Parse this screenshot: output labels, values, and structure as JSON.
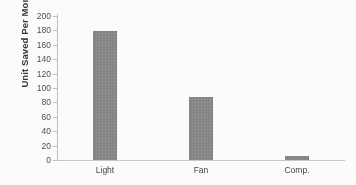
{
  "chart_data": {
    "type": "bar",
    "title": "",
    "subtitle": "",
    "xlabel": "",
    "ylabel": "Unit Saved Per Month",
    "categories": [
      "Light",
      "Fan",
      "Comp."
    ],
    "values": [
      179,
      87,
      6
    ],
    "series": [
      {
        "name": "Unit Saved Per Month",
        "values": [
          179,
          87,
          6
        ]
      }
    ],
    "ylim": [
      0,
      200
    ],
    "ytick_labels": [
      "0",
      "20",
      "40",
      "60",
      "80",
      "100",
      "120",
      "140",
      "160",
      "180",
      "200"
    ],
    "ytick_values": [
      0,
      20,
      40,
      60,
      80,
      100,
      120,
      140,
      160,
      180,
      200
    ],
    "grid": false,
    "legend": "none",
    "bar_color": "#808080",
    "axis_color": "#c2c2c2"
  }
}
